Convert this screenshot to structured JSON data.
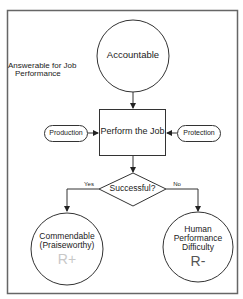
{
  "diagram": {
    "side_note": "Answerable for Job Performance",
    "side_note_lines": [
      "Answerable for Job",
      "Performance"
    ],
    "nodes": {
      "accountable": {
        "label": "Accountable"
      },
      "perform_job": {
        "label": "Perform the Job"
      },
      "production": {
        "label": "Production"
      },
      "protection": {
        "label": "Protection"
      },
      "decision": {
        "label": "Successful?"
      },
      "commendable": {
        "lines": [
          "Commendable",
          "(Praiseworthy)"
        ],
        "symbol": "R+"
      },
      "difficulty": {
        "lines": [
          "Human",
          "Performance",
          "Difficulty"
        ],
        "symbol": "R-"
      }
    },
    "edges": {
      "yes_label": "Yes",
      "no_label": "No"
    },
    "colors": {
      "stroke": "#333333",
      "frame": "#666666",
      "r_plus": "#c8c8c8",
      "r_minus": "#555555"
    }
  }
}
